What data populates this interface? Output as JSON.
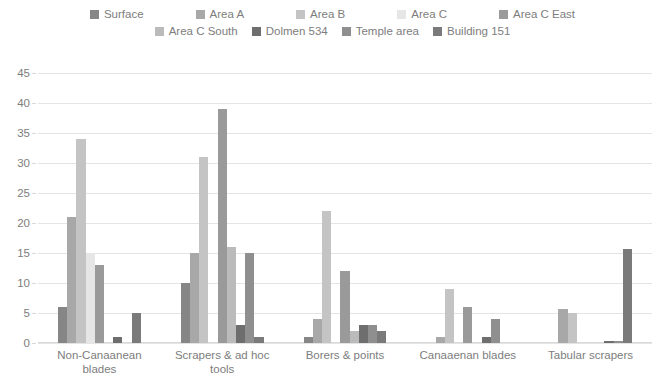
{
  "chart_data": {
    "type": "bar",
    "title": "",
    "subtitle": "",
    "xlabel": "",
    "ylabel": "",
    "ylim": [
      0,
      45
    ],
    "ytick_step": 5,
    "yticks": [
      "45",
      "40",
      "35",
      "30",
      "25",
      "20",
      "15",
      "10",
      "5",
      "0"
    ],
    "grid": true,
    "legend_position": "top",
    "orientation": "vertical",
    "grouping": "clustered",
    "categories": [
      "Non-Canaanean blades",
      "Scrapers & ad hoc tools",
      "Borers & points",
      "Canaaenan blades",
      "Tabular scrapers"
    ],
    "series": [
      {
        "name": "Surface",
        "color": "#868686",
        "values": [
          6,
          10,
          1,
          0,
          0
        ]
      },
      {
        "name": "Area A",
        "color": "#a8a8a8",
        "values": [
          21,
          15,
          4,
          1,
          5.7
        ]
      },
      {
        "name": "Area B",
        "color": "#c4c4c4",
        "values": [
          34,
          31,
          22,
          9,
          5
        ]
      },
      {
        "name": "Area C",
        "color": "#e6e6e6",
        "values": [
          15,
          0,
          0,
          0,
          0
        ]
      },
      {
        "name": "Area C East",
        "color": "#9a9a9a",
        "values": [
          13,
          39,
          12,
          6,
          0
        ]
      },
      {
        "name": "Area C South",
        "color": "#bbbbbb",
        "values": [
          0,
          16,
          2,
          0,
          0
        ]
      },
      {
        "name": "Dolmen 534",
        "color": "#6e6e6e",
        "values": [
          1,
          3,
          3,
          1,
          0.3
        ]
      },
      {
        "name": "Temple area",
        "color": "#8f8f8f",
        "values": [
          0,
          15,
          3,
          4,
          0.3
        ]
      },
      {
        "name": "Building 151",
        "color": "#7a7a7a",
        "values": [
          5,
          1,
          2,
          0,
          15.7
        ]
      }
    ]
  },
  "legend": {
    "row1": [
      "Surface",
      "Area A",
      "Area B",
      "Area C",
      "Area C East"
    ],
    "row2": [
      "Area C South",
      "Dolmen 534",
      "Temple area",
      "Building 151"
    ]
  }
}
